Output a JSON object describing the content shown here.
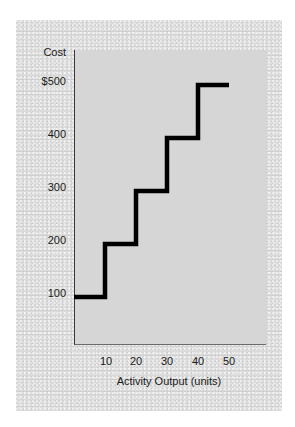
{
  "chart_data": {
    "type": "line",
    "subtype": "step",
    "title": "",
    "xlabel": "Activity Output (units)",
    "ylabel": "Cost",
    "x_ticks": [
      "10",
      "20",
      "30",
      "40",
      "50"
    ],
    "y_ticks": [
      "100",
      "200",
      "300",
      "400",
      "$500"
    ],
    "xlim": [
      0,
      60
    ],
    "ylim": [
      0,
      550
    ],
    "grid": false,
    "legend": null,
    "series": [
      {
        "name": "Step cost",
        "color": "#000000",
        "steps": [
          {
            "x_start": 0,
            "x_end": 10,
            "cost": 100
          },
          {
            "x_start": 10,
            "x_end": 20,
            "cost": 200
          },
          {
            "x_start": 20,
            "x_end": 30,
            "cost": 300
          },
          {
            "x_start": 30,
            "x_end": 40,
            "cost": 400
          },
          {
            "x_start": 40,
            "x_end": 50,
            "cost": 500
          }
        ]
      }
    ]
  },
  "labels": {
    "y_axis_title": "Cost",
    "x_axis_title": "Activity Output (units)",
    "y_ticks": [
      {
        "label": "$500",
        "value": 500
      },
      {
        "label": "400",
        "value": 400
      },
      {
        "label": "300",
        "value": 300
      },
      {
        "label": "200",
        "value": 200
      },
      {
        "label": "100",
        "value": 100
      }
    ],
    "x_ticks": [
      {
        "label": "10",
        "value": 10
      },
      {
        "label": "20",
        "value": 20
      },
      {
        "label": "30",
        "value": 30
      },
      {
        "label": "40",
        "value": 40
      },
      {
        "label": "50",
        "value": 50
      }
    ]
  },
  "colors": {
    "panel": "#dcdcdc",
    "plot": "#d6d6d6",
    "line": "#000000",
    "text": "#1a1a1a"
  }
}
